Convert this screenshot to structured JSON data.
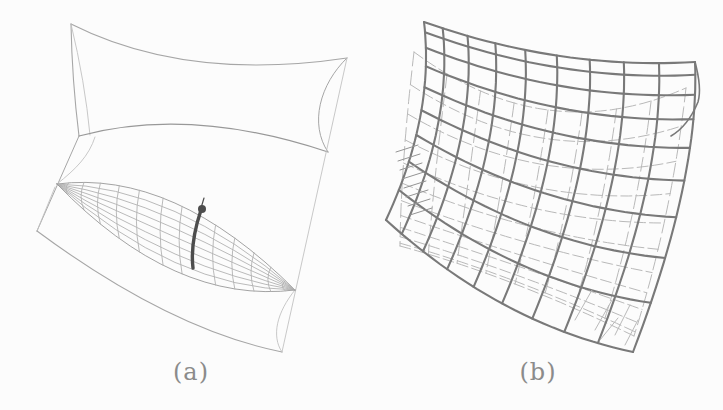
{
  "figure": {
    "background": "#fcfcfc",
    "labels": {
      "a": "(a)",
      "b": "(b)"
    },
    "colors": {
      "outline_a": "#a6a6a6",
      "outline_a_faint": "#c2c2c2",
      "silhouette_a": "#989898",
      "grid_a": "#b2b2b2",
      "geodesic": "#4d4d4d",
      "marked_point": "#4d4d4d",
      "mesh_front": "#797979",
      "mesh_back": "#b9b9b9",
      "hatch": "#949494",
      "label_text": "#8b8b8b"
    }
  }
}
